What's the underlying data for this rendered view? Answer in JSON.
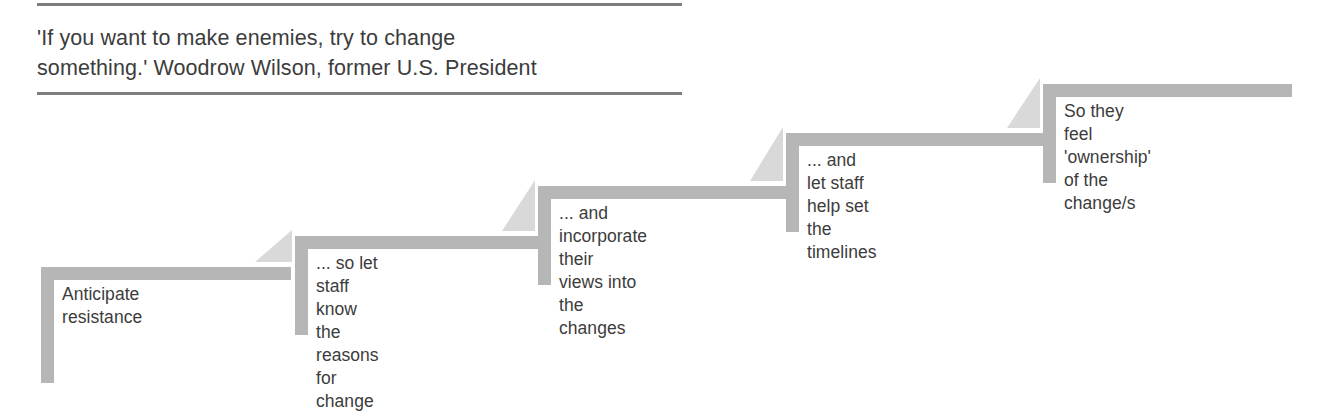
{
  "quote": {
    "text": "'If you want to make enemies, try to change\nsomething.' Woodrow Wilson, former U.S. President",
    "rule_color": "#7d7d7d"
  },
  "diagram": {
    "type": "staircase",
    "bar_color": "#b6b6b6",
    "notch_color": "#d9d9d9",
    "text_color": "#3c3c3c",
    "steps": [
      {
        "index": 1,
        "label": "Anticipate resistance",
        "left": 41,
        "top": 267,
        "top_bar_width": 250,
        "left_bar_height": 116,
        "has_notch": true
      },
      {
        "index": 2,
        "label": "... so let staff know\nthe reasons for change",
        "left": 295,
        "top": 236,
        "top_bar_width": 243,
        "left_bar_height": 99,
        "has_notch": true
      },
      {
        "index": 3,
        "label": "... and incorporate their\nviews into the changes",
        "left": 538,
        "top": 186,
        "top_bar_width": 248,
        "left_bar_height": 99,
        "has_notch": true
      },
      {
        "index": 4,
        "label": "... and let staff help set\nthe timelines",
        "left": 786,
        "top": 133,
        "top_bar_width": 257,
        "left_bar_height": 99,
        "has_notch": true
      },
      {
        "index": 5,
        "label": "So they feel 'ownership'\nof the change/s",
        "left": 1043,
        "top": 84,
        "top_bar_width": 249,
        "left_bar_height": 99,
        "has_notch": false
      }
    ]
  }
}
